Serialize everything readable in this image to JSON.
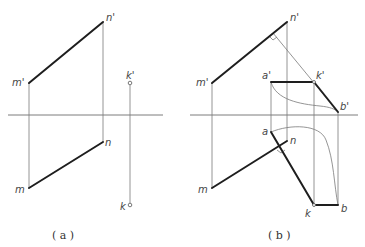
{
  "figures": [
    {
      "id": "a",
      "caption": "( a )",
      "labels": {
        "m_prime": "m'",
        "n_prime": "n'",
        "k_prime": "k'",
        "m": "m",
        "n": "n",
        "k": "k"
      }
    },
    {
      "id": "b",
      "caption": "( b )",
      "labels": {
        "m_prime": "m'",
        "n_prime": "n'",
        "a_prime": "a'",
        "k_prime": "k'",
        "b_prime": "b'",
        "m": "m",
        "n": "n",
        "a": "a",
        "k": "k",
        "b": "b"
      }
    }
  ],
  "colors": {
    "thick_line": "#1e1e1e",
    "thin_line": "#7a7a7a",
    "background": "#ffffff"
  }
}
